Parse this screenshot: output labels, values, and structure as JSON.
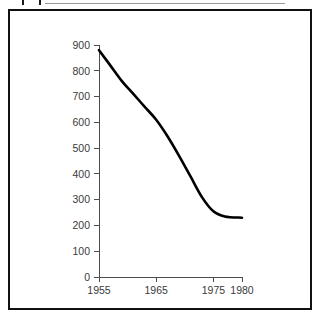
{
  "document_header": {
    "checkbox_name": "checkbox-icon",
    "title": "Number of ...",
    "visible_note": "clipped at top edge of screenshot"
  },
  "figure": {
    "frame_color": "#111111",
    "background": "#ffffff"
  },
  "chart_data": {
    "type": "line",
    "title": "",
    "subtitle": "",
    "xlabel": "",
    "ylabel": "",
    "xlim": [
      1955,
      1980
    ],
    "ylim": [
      0,
      900
    ],
    "grid": false,
    "legend": false,
    "legend_position": "none",
    "xticks": [
      1955,
      1965,
      1975,
      1980
    ],
    "xtick_labels": [
      "1955",
      "1965",
      "1975",
      "1980"
    ],
    "yticks": [
      0,
      100,
      200,
      300,
      400,
      500,
      600,
      700,
      800,
      900
    ],
    "ytick_labels": [
      "0",
      "100",
      "200",
      "300",
      "400",
      "500",
      "600",
      "700",
      "800",
      "900"
    ],
    "line_color": "#000000",
    "series": [
      {
        "name": "series-1",
        "x": [
          1955,
          1957,
          1959,
          1961,
          1963,
          1965,
          1967,
          1969,
          1971,
          1973,
          1975,
          1977,
          1980
        ],
        "values": [
          880,
          820,
          760,
          710,
          660,
          610,
          545,
          470,
          390,
          310,
          255,
          235,
          230
        ]
      }
    ]
  }
}
